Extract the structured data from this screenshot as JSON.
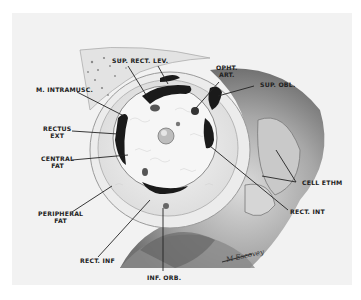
{
  "figure": {
    "signature": "M Escovey",
    "colors": {
      "paper": "#ffffff",
      "plate": "#f2f2f2",
      "ink": "#222222",
      "muscle": "#1a1a1a",
      "shadow": "#6e6e6e"
    }
  },
  "labels": {
    "sup_rect": "SUP. RECT.",
    "lev": "LEV.",
    "opht_art_1": "OPHT.",
    "opht_art_2": "ART.",
    "m_intramusc": "M. INTRAMUSC.",
    "sup_obl": "SUP. OBL.",
    "rectus_ext_1": "RECTUS",
    "rectus_ext_2": "EXT",
    "central_fat_1": "CENTRAL",
    "central_fat_2": "FAT",
    "cell_ethm": "CELL ETHM",
    "rect_int": "RECT. INT",
    "peripheral_fat_1": "PERIPHERAL",
    "peripheral_fat_2": "FAT",
    "rect_inf": "RECT. INF",
    "inf_orb": "INF. ORB."
  }
}
